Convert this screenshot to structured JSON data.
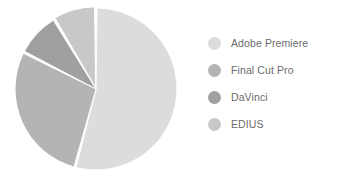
{
  "chart_data": {
    "type": "pie",
    "title": "",
    "categories": [
      "Adobe Premiere",
      "Final Cut Pro",
      "DaVinci",
      "EDIUS"
    ],
    "values": [
      54,
      28,
      9,
      9
    ],
    "units": "percent",
    "legend_position": "right",
    "grid": false,
    "slice_angles_deg": [
      195,
      102,
      32,
      31
    ],
    "colors": [
      "#dcdcdc",
      "#b4b4b4",
      "#a0a0a0",
      "#c8c8c8"
    ],
    "start_angle_deg": 0,
    "direction": "clockwise",
    "slices": [
      {
        "label": "Adobe Premiere",
        "value": 54,
        "color": "#dcdcdc",
        "sweep_deg": 195
      },
      {
        "label": "Final Cut Pro",
        "value": 28,
        "color": "#b4b4b4",
        "sweep_deg": 102
      },
      {
        "label": "DaVinci",
        "value": 9,
        "color": "#a0a0a0",
        "sweep_deg": 32
      },
      {
        "label": "EDIUS",
        "value": 9,
        "color": "#c8c8c8",
        "sweep_deg": 31
      }
    ]
  },
  "legend": {
    "items": [
      {
        "label": "Adobe Premiere",
        "color": "#dcdcdc"
      },
      {
        "label": "Final Cut Pro",
        "color": "#b4b4b4"
      },
      {
        "label": "DaVinci",
        "color": "#a0a0a0"
      },
      {
        "label": "EDIUS",
        "color": "#c8c8c8"
      }
    ]
  },
  "style": {
    "background": "#ffffff",
    "separator_color": "#ffffff",
    "label_color": "#6b6b6b"
  }
}
